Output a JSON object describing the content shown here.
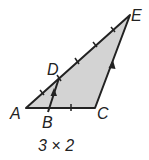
{
  "diagram": {
    "points": {
      "A": {
        "label": "A",
        "x": 26,
        "y": 108
      },
      "B": {
        "label": "B",
        "x": 48,
        "y": 108
      },
      "C": {
        "label": "C",
        "x": 95,
        "y": 108
      },
      "D": {
        "label": "D",
        "x": 59,
        "y": 78
      },
      "E": {
        "label": "E",
        "x": 130,
        "y": 15
      }
    },
    "fill_color": "#d3d3d3",
    "stroke_color": "#222222",
    "parallel_segments": [
      "DB",
      "EC"
    ],
    "caption": "3 × 2"
  }
}
